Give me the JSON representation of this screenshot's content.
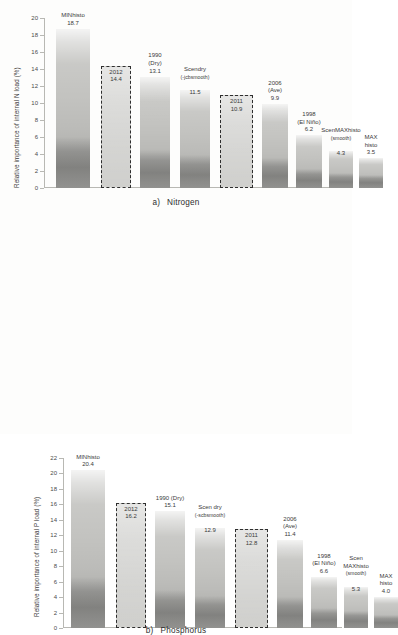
{
  "figure": {
    "panels": [
      {
        "id": "a",
        "caption_lead": "a)",
        "caption_text": "Nitrogen",
        "ylabel": "Relative importance of internal N load (%)",
        "yticks": [
          "0",
          "2",
          "4",
          "6",
          "8",
          "10",
          "12",
          "14",
          "16",
          "18",
          "20"
        ],
        "ymax": 20,
        "bars": [
          {
            "name": "MINhisto",
            "line1": "MINhisto",
            "line2": "",
            "value": "18.7",
            "v": 18.7,
            "boxed": false,
            "foot": 6.0
          },
          {
            "name": "2012",
            "line1": "2012",
            "line2": "",
            "value": "14.4",
            "v": 14.4,
            "boxed": true,
            "foot": 0.0
          },
          {
            "name": "1990 (Dry)",
            "line1": "1990",
            "line2": "(Dry)",
            "value": "13.1",
            "v": 13.1,
            "boxed": false,
            "foot": 4.5
          },
          {
            "name": "Scendry",
            "line1": "Scendry",
            "line2": "(-jcbsmooth)",
            "value": "11.5",
            "v": 11.5,
            "boxed": false,
            "foot": 3.9
          },
          {
            "name": "2011",
            "line1": "2011",
            "line2": "",
            "value": "10.9",
            "v": 10.9,
            "boxed": true,
            "foot": 0.0
          },
          {
            "name": "2006 (Ave)",
            "line1": "2006",
            "line2": "(Ave)",
            "value": "9.9",
            "v": 9.9,
            "boxed": false,
            "foot": 3.5
          },
          {
            "name": "1998 (El Nino)",
            "line1": "1998",
            "line2": "(El Niño)",
            "value": "6.2",
            "v": 6.2,
            "boxed": false,
            "foot": 2.2
          },
          {
            "name": "ScenMAXhisto",
            "line1": "ScenMAXhisto",
            "line2": "(smooth)",
            "value": "4.3",
            "v": 4.3,
            "boxed": false,
            "foot": 1.8
          },
          {
            "name": "MAX histo",
            "line1": "MAX",
            "line2": "histo",
            "value": "3.5",
            "v": 3.5,
            "boxed": false,
            "foot": 1.5
          }
        ]
      },
      {
        "id": "b",
        "caption_lead": "b)",
        "caption_text": "Phosphorus",
        "ylabel": "Relative importance of internal P load (%)",
        "yticks": [
          "0",
          "2",
          "4",
          "6",
          "8",
          "10",
          "12",
          "14",
          "16",
          "18",
          "20",
          "22"
        ],
        "ymax": 22,
        "bars": [
          {
            "name": "MINhisto",
            "line1": "MINhisto",
            "line2": "",
            "value": "20.4",
            "v": 20.4,
            "boxed": false,
            "foot": 6.6
          },
          {
            "name": "2012",
            "line1": "2012",
            "line2": "",
            "value": "16.2",
            "v": 16.2,
            "boxed": true,
            "foot": 0.0
          },
          {
            "name": "1990 (Dry)",
            "line1": "1990 (Dry)",
            "line2": "",
            "value": "15.1",
            "v": 15.1,
            "boxed": false,
            "foot": 4.9
          },
          {
            "name": "Scen dry",
            "line1": "Scen dry",
            "line2": "(-scbsmooth)",
            "value": "12.9",
            "v": 12.9,
            "boxed": false,
            "foot": 4.2
          },
          {
            "name": "2011",
            "line1": "2011",
            "line2": "",
            "value": "12.8",
            "v": 12.8,
            "boxed": true,
            "foot": 0.0
          },
          {
            "name": "2006 (Ave)",
            "line1": "2006",
            "line2": "(Ave)",
            "value": "11.4",
            "v": 11.4,
            "boxed": false,
            "foot": 4.0
          },
          {
            "name": "1998 (El Nino)",
            "line1": "1998",
            "line2": "(El Niño)",
            "value": "6.6",
            "v": 6.6,
            "boxed": false,
            "foot": 2.6
          },
          {
            "name": "Scen MAXhisto",
            "line1": "Scen",
            "line2": "MAXhisto",
            "line3": "(smooth)",
            "value": "5.3",
            "v": 5.3,
            "boxed": false,
            "foot": 2.2
          },
          {
            "name": "MAX histo",
            "line1": "MAX",
            "line2": "histo",
            "value": "4.0",
            "v": 4.0,
            "boxed": false,
            "foot": 1.7
          }
        ]
      }
    ]
  },
  "chart_data": [
    {
      "type": "bar",
      "title": "a) Nitrogen",
      "xlabel": "",
      "ylabel": "Relative importance of internal N load (%)",
      "ylim": [
        0,
        20
      ],
      "grid": false,
      "legend": "none",
      "categories": [
        "MINhisto",
        "2012",
        "1990 (Dry)",
        "Scendry (-jcbsmooth)",
        "2011",
        "2006 (Ave)",
        "1998 (El Niño)",
        "ScenMAXhisto (smooth)",
        "MAX histo"
      ],
      "values": [
        18.7,
        14.4,
        13.1,
        11.5,
        10.9,
        9.9,
        6.2,
        4.3,
        3.5
      ],
      "highlighted_categories": [
        "2012",
        "2011"
      ],
      "annotations": [
        "2012 and 2011 bars are outlined with dashed borders and labelled inside the bar"
      ]
    },
    {
      "type": "bar",
      "title": "b) Phosphorus",
      "xlabel": "",
      "ylabel": "Relative importance of internal P load (%)",
      "ylim": [
        0,
        22
      ],
      "grid": false,
      "legend": "none",
      "categories": [
        "MINhisto",
        "2012",
        "1990 (Dry)",
        "Scen dry (-scbsmooth)",
        "2011",
        "2006 (Ave)",
        "1998 (El Niño)",
        "Scen MAXhisto (smooth)",
        "MAX histo"
      ],
      "values": [
        20.4,
        16.2,
        15.1,
        12.9,
        12.8,
        11.4,
        6.6,
        5.3,
        4.0
      ],
      "highlighted_categories": [
        "2012",
        "2011"
      ],
      "annotations": [
        "2012 and 2011 bars are outlined with dashed borders and labelled inside the bar"
      ]
    }
  ]
}
